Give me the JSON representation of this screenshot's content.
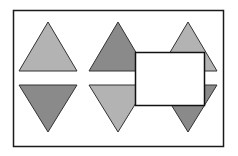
{
  "diagram": {
    "frame": {
      "x": 13,
      "y": 10,
      "width": 210,
      "height": 136,
      "stroke": "#1a1a1a"
    },
    "colors": {
      "light": "#b3b3b3",
      "dark": "#8a8a8a",
      "stroke": "#333333",
      "box_fill": "#ffffff",
      "box_stroke": "#111111"
    },
    "triangles": [
      {
        "id": "col1-up",
        "direction": "up",
        "cx": 48,
        "shade": "light"
      },
      {
        "id": "col1-down",
        "direction": "down",
        "cx": 48,
        "shade": "dark"
      },
      {
        "id": "col2-up",
        "direction": "up",
        "cx": 118,
        "shade": "dark"
      },
      {
        "id": "col2-down",
        "direction": "down",
        "cx": 118,
        "shade": "light"
      },
      {
        "id": "col3-up",
        "direction": "up",
        "cx": 188,
        "shade": "light"
      },
      {
        "id": "col3-down",
        "direction": "down",
        "cx": 188,
        "shade": "dark"
      }
    ],
    "occluding_box": {
      "x": 135,
      "y": 52,
      "width": 69,
      "height": 53
    }
  }
}
